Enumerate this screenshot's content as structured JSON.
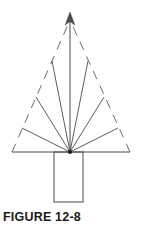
{
  "figure": {
    "caption": "FIGURE 12-8",
    "colors": {
      "background": "#ffffff",
      "stroke": "#4a4a4a",
      "stroke_dashed": "#6b6b6b",
      "vertex_dot": "#1a1a1a",
      "caption_text": "#1a1a1a"
    },
    "geometry": {
      "apex": {
        "x": 70,
        "y": 20
      },
      "base_left": {
        "x": 12,
        "y": 152
      },
      "base_right": {
        "x": 130,
        "y": 152
      },
      "vertex": {
        "x": 70,
        "y": 152
      },
      "arrow_tip": {
        "x": 70,
        "y": 13
      }
    },
    "dashed_sides": [
      {
        "name": "left-side",
        "x1": 12,
        "y1": 152,
        "x2": 70,
        "y2": 20
      },
      {
        "name": "right-side",
        "x1": 130,
        "y1": 152,
        "x2": 70,
        "y2": 20
      }
    ],
    "baseline": {
      "x1": 12,
      "y1": 152,
      "x2": 130,
      "y2": 152
    },
    "rays": [
      {
        "name": "ray-left-outer",
        "x2": 22,
        "y2": 128
      },
      {
        "name": "ray-left-middle",
        "x2": 36,
        "y2": 97
      },
      {
        "name": "ray-left-inner",
        "x2": 52,
        "y2": 61
      },
      {
        "name": "ray-center-arrow",
        "x2": 70,
        "y2": 13
      },
      {
        "name": "ray-right-inner",
        "x2": 88,
        "y2": 61
      },
      {
        "name": "ray-right-middle",
        "x2": 104,
        "y2": 97
      },
      {
        "name": "ray-right-outer",
        "x2": 118,
        "y2": 128
      }
    ],
    "ray_count": 7,
    "trunk": {
      "x": 54,
      "y": 152,
      "width": 29,
      "height": 50
    }
  }
}
